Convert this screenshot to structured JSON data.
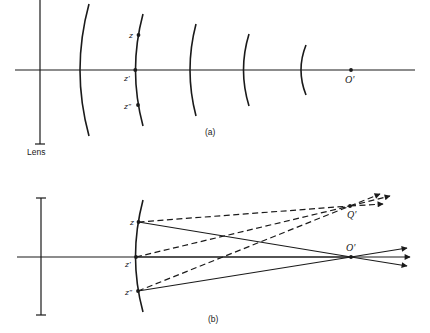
{
  "figure": {
    "panel_a": {
      "caption": "(a)",
      "lens_label": "Lens",
      "points": {
        "z": "z",
        "z_prime": "z'",
        "z_double_prime": "z\"",
        "image_point": "O'"
      },
      "wavefront_count": 5
    },
    "panel_b": {
      "caption": "(b)",
      "points": {
        "z": "z",
        "z_prime": "z'",
        "z_double_prime": "z\"",
        "image_point_axis": "O'",
        "image_point_off_axis": "Q'"
      }
    }
  },
  "colors": {
    "stroke": "#1a1a1a",
    "background": "#ffffff"
  }
}
